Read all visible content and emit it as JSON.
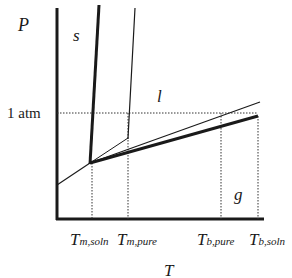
{
  "diagram": {
    "type": "phase-diagram",
    "y_axis_label": "P",
    "x_axis_label": "T",
    "pressure_reference_label": "1 atm",
    "region_labels": {
      "solid": "s",
      "liquid": "l",
      "gas": "g"
    },
    "tick_labels": [
      {
        "main": "T",
        "sub": "m,soln"
      },
      {
        "main": "T",
        "sub": "m,pure"
      },
      {
        "main": "T",
        "sub": "b,pure"
      },
      {
        "main": "T",
        "sub": "b,soln"
      }
    ],
    "curves": [
      {
        "name": "solution solid-liquid boundary",
        "style": "thick"
      },
      {
        "name": "pure solid-liquid boundary",
        "style": "thin"
      },
      {
        "name": "pure liquid-gas boundary",
        "style": "thin"
      },
      {
        "name": "solution liquid-gas boundary",
        "style": "thick"
      },
      {
        "name": "solid-gas boundary",
        "style": "thin"
      }
    ],
    "colors": {
      "line": "#1a1a1a",
      "background": "#ffffff"
    }
  }
}
